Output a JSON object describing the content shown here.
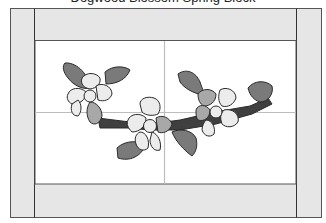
{
  "caption": {
    "text": "Dogwood Blossom Spring Block"
  },
  "diagram": {
    "type": "quilt-block-pattern",
    "elements": {
      "flowers": 3,
      "leaves": 6,
      "branch": 1,
      "border_strips": [
        "top",
        "bottom",
        "left",
        "right"
      ],
      "guide_lines": [
        "horizontal-center",
        "vertical-center"
      ]
    },
    "colors": {
      "border_fill": "#e6e6e6",
      "border_stroke": "#555555",
      "center_fill": "#ffffff",
      "guide_line": "#bdbdbd",
      "leaf_fill": "#7a7a7a",
      "branch_fill": "#3f3f3f",
      "petal_light": "#ececec",
      "petal_mid": "#a8a8a8",
      "outline": "#2b2b2b"
    }
  }
}
